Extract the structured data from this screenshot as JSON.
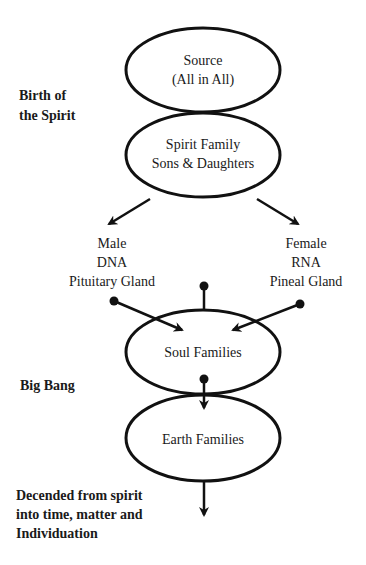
{
  "nodes": {
    "source": {
      "line1": "Source",
      "line2": "(All in All)"
    },
    "spirit_family": {
      "line1": "Spirit Family",
      "line2": "Sons & Daughters"
    },
    "male": {
      "line1": "Male",
      "line2": "DNA",
      "line3": "Pituitary Gland"
    },
    "female": {
      "line1": "Female",
      "line2": "RNA",
      "line3": "Pineal Gland"
    },
    "soul_families": {
      "line1": "Soul Families"
    },
    "earth_families": {
      "line1": "Earth Families"
    }
  },
  "side_labels": {
    "birth": {
      "line1": "Birth of",
      "line2": "the Spirit"
    },
    "big_bang": {
      "line1": "Big Bang"
    },
    "descended": {
      "line1": "Decended from spirit",
      "line2": "into time, matter and",
      "line3": "Individuation"
    }
  },
  "colors": {
    "stroke": "#111111",
    "background": "#ffffff"
  }
}
